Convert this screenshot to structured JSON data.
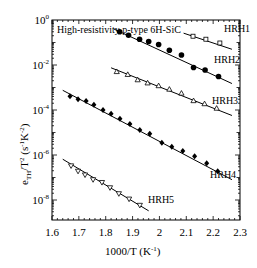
{
  "chart_data": {
    "type": "scatter",
    "title": "",
    "annotation": "High-resistivity p-type 6H-SiC",
    "xlabel": "1000/T (K",
    "xlabel_sup": "-1",
    "xlabel_close": ")",
    "ylabel_main": "e",
    "ylabel_sub": "TH",
    "ylabel_mid": "/T",
    "ylabel_sup": "2",
    "ylabel_units": "(s",
    "ylabel_units_sup1": "-1",
    "ylabel_units_k": "K",
    "ylabel_units_sup2": "-2",
    "ylabel_units_close": ")",
    "xlim": [
      1.6,
      2.3
    ],
    "ylim_log10": [
      -8.9,
      0
    ],
    "yscale": "log",
    "grid": false,
    "x_ticks": [
      "1.6",
      "1.7",
      "1.8",
      "1.9",
      "2",
      "2.1",
      "2.2",
      "2.3"
    ],
    "y_ticks": [
      {
        "base": "10",
        "exp": "0",
        "log": 0
      },
      {
        "base": "10",
        "exp": "-2",
        "log": -2
      },
      {
        "base": "10",
        "exp": "-4",
        "log": -4
      },
      {
        "base": "10",
        "exp": "-6",
        "log": -6
      },
      {
        "base": "10",
        "exp": "-8",
        "log": -8
      }
    ],
    "series": [
      {
        "name": "HRH1",
        "marker": "open-square",
        "x": [
          2.125,
          2.173,
          2.225
        ],
        "y": [
          0.19,
          0.14,
          0.095
        ],
        "fit_x": [
          2.09,
          2.27
        ],
        "fit_y": [
          0.26,
          0.05
        ],
        "label_pos": [
          224,
          32
        ]
      },
      {
        "name": "HRH2",
        "marker": "filled-circle",
        "x": [
          1.852,
          1.885,
          1.926,
          1.96,
          1.997,
          2.037,
          2.082,
          2.127,
          2.17,
          2.22
        ],
        "y": [
          0.3,
          0.21,
          0.14,
          0.11,
          0.082,
          0.045,
          0.028,
          0.0077,
          0.006,
          0.0031
        ],
        "fit_x": [
          1.83,
          2.27
        ],
        "fit_y": [
          0.4,
          0.0015
        ],
        "label_pos": [
          214,
          63
        ]
      },
      {
        "name": "HRH3",
        "marker": "open-triangle-up",
        "x": [
          1.841,
          1.882,
          1.919,
          1.956,
          1.997,
          2.037,
          2.082,
          2.127,
          2.168,
          2.213
        ],
        "y": [
          0.0051,
          0.0038,
          0.0022,
          0.0016,
          0.0012,
          0.00084,
          0.00056,
          0.00026,
          0.00019,
          0.00012
        ],
        "fit_x": [
          1.82,
          2.27
        ],
        "fit_y": [
          0.0075,
          5.7e-05
        ],
        "label_pos": [
          212,
          104
        ]
      },
      {
        "name": "HRH4",
        "marker": "filled-diamond",
        "x": [
          1.667,
          1.697,
          1.727,
          1.756,
          1.79,
          1.82,
          1.853,
          1.89,
          1.927,
          1.964,
          2.009,
          2.046,
          2.087,
          2.131,
          2.176,
          2.217
        ],
        "y": [
          0.00041,
          0.0003,
          0.00025,
          0.00017,
          0.0001,
          6.8e-05,
          4.1e-05,
          2.4e-05,
          1.3e-05,
          8.7e-06,
          3.5e-06,
          2.3e-06,
          1.5e-06,
          8.9e-07,
          4.3e-07,
          1.9e-07
        ],
        "fit_x": [
          1.64,
          2.27
        ],
        "fit_y": [
          0.00075,
          8e-08
        ],
        "label_pos": [
          210,
          178
        ]
      },
      {
        "name": "HRH5",
        "marker": "open-triangle-down",
        "x": [
          1.671,
          1.697,
          1.723,
          1.753,
          1.786,
          1.816,
          1.849,
          1.887,
          1.927
        ],
        "y": [
          3.3e-07,
          1.9e-07,
          1.3e-07,
          8e-08,
          6e-08,
          3.5e-08,
          1.9e-08,
          1.1e-08,
          5.8e-09
        ],
        "fit_x": [
          1.64,
          1.96
        ],
        "fit_y": [
          6.5e-07,
          3.3e-09
        ],
        "label_pos": [
          148,
          203
        ]
      }
    ]
  }
}
